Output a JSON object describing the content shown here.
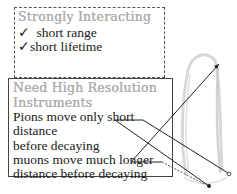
{
  "top_box": {
    "heading": "Strongly Interacting",
    "items": [
      {
        "icon": "check-icon",
        "glyph": "✓",
        "text": " short range"
      },
      {
        "icon": "check-icon",
        "glyph": "✓",
        "text": "short lifetime"
      }
    ]
  },
  "bottom_box": {
    "heading_line1": "Need High Resolution",
    "heading_line2": "Instruments",
    "lines": [
      "Pions move only short",
      "distance",
      "before decaying",
      "muons move much longer",
      "distance before decaying"
    ]
  },
  "annotations": {
    "arrows": [
      {
        "from_word": "short",
        "to": "track-endpoint-right"
      },
      {
        "from_word": "short",
        "to": "track-endpoint-bottom"
      },
      {
        "from_word": "longer",
        "to": "track-top"
      }
    ]
  },
  "colors": {
    "heading": "#b0b0b0",
    "text": "#1a1a1a",
    "border": "#444444",
    "track": "#c8c8c8"
  }
}
